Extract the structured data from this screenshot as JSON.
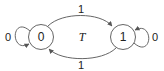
{
  "diagram": {
    "type": "state-machine",
    "name": "T",
    "stroke_color": "#666666",
    "text_color": "#222222",
    "states": [
      {
        "id": "s0",
        "label": "0",
        "cx": 41,
        "cy": 37,
        "r": 12.5
      },
      {
        "id": "s1",
        "label": "1",
        "cx": 123,
        "cy": 37,
        "r": 12.5
      }
    ],
    "transitions": [
      {
        "from": "0",
        "to": "0",
        "label": "0",
        "kind": "self-loop-left"
      },
      {
        "from": "0",
        "to": "1",
        "label": "1",
        "kind": "arc-top"
      },
      {
        "from": "1",
        "to": "0",
        "label": "1",
        "kind": "arc-bottom"
      },
      {
        "from": "1",
        "to": "1",
        "label": "0",
        "kind": "self-loop-right"
      }
    ]
  }
}
